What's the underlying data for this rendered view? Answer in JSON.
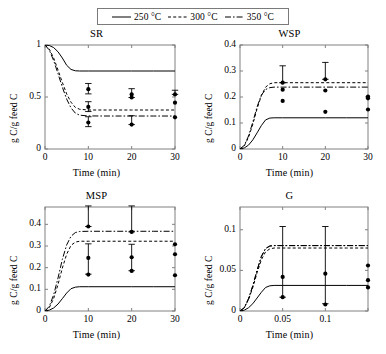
{
  "figure": {
    "legend": {
      "entries": [
        {
          "label": "250 °C",
          "style": "solid",
          "color": "#000000"
        },
        {
          "label": "300 °C",
          "style": "dashed",
          "color": "#000000"
        },
        {
          "label": "350 °C",
          "style": "dashdot",
          "color": "#000000"
        }
      ]
    },
    "axis_label_x": "Time (min)",
    "axis_label_y": "g C/g feed C"
  },
  "chart_data": [
    {
      "type": "line",
      "title": "SR",
      "xlabel": "Time (min)",
      "ylabel": "g C/g feed C",
      "xlim": [
        0,
        30
      ],
      "ylim": [
        0,
        1
      ],
      "xticks": [
        0,
        10,
        20,
        30
      ],
      "yticks": [
        0,
        0.5,
        1
      ],
      "xtick_labels": [
        "0",
        "10",
        "20",
        "30"
      ],
      "ytick_labels": [
        "0",
        "0.5",
        "1"
      ],
      "grid": false,
      "legend_position": "figure-top",
      "series": [
        {
          "name": "250 °C",
          "style": "solid",
          "x": [
            0,
            1,
            2,
            3,
            4,
            5,
            6,
            7,
            8,
            10,
            15,
            20,
            25,
            30
          ],
          "values": [
            1,
            0.995,
            0.975,
            0.935,
            0.875,
            0.805,
            0.765,
            0.752,
            0.75,
            0.75,
            0.75,
            0.75,
            0.75,
            0.75
          ]
        },
        {
          "name": "300 °C",
          "style": "dashed",
          "x": [
            0,
            1,
            2,
            3,
            4,
            5,
            6,
            7,
            8,
            10,
            15,
            20,
            25,
            30
          ],
          "values": [
            1,
            0.96,
            0.875,
            0.76,
            0.64,
            0.53,
            0.45,
            0.4,
            0.382,
            0.375,
            0.375,
            0.375,
            0.375,
            0.375
          ]
        },
        {
          "name": "350 °C",
          "style": "dashdot",
          "x": [
            0,
            1,
            2,
            3,
            4,
            5,
            6,
            7,
            8,
            10,
            15,
            20,
            25,
            30
          ],
          "values": [
            1,
            0.95,
            0.85,
            0.725,
            0.595,
            0.48,
            0.395,
            0.345,
            0.325,
            0.318,
            0.317,
            0.317,
            0.317,
            0.317
          ]
        }
      ],
      "scatter": [
        {
          "x": 10,
          "y": 0.575,
          "yerr_low": 0.045,
          "yerr_high": 0.055
        },
        {
          "x": 10,
          "y": 0.405,
          "yerr_low": 0.045,
          "yerr_high": 0.05
        },
        {
          "x": 10,
          "y": 0.255,
          "yerr_low": 0.04,
          "yerr_high": 0.055
        },
        {
          "x": 20,
          "y": 0.525,
          "yerr_low": 0.03,
          "yerr_high": 0.055
        },
        {
          "x": 20,
          "y": 0.495,
          "yerr_low": 0.0,
          "yerr_high": 0.0
        },
        {
          "x": 20,
          "y": 0.235,
          "yerr_low": 0.0,
          "yerr_high": 0.085
        },
        {
          "x": 30,
          "y": 0.525,
          "yerr_low": 0.0,
          "yerr_high": 0.04
        },
        {
          "x": 30,
          "y": 0.445,
          "yerr_low": 0.0,
          "yerr_high": 0.0
        },
        {
          "x": 30,
          "y": 0.305,
          "yerr_low": 0.0,
          "yerr_high": 0.0
        }
      ]
    },
    {
      "type": "line",
      "title": "WSP",
      "xlabel": "Time (min)",
      "ylabel": "g C/g feed C",
      "xlim": [
        0,
        30
      ],
      "ylim": [
        0,
        0.4
      ],
      "xticks": [
        0,
        10,
        20,
        30
      ],
      "yticks": [
        0,
        0.1,
        0.2,
        0.3,
        0.4
      ],
      "xtick_labels": [
        "0",
        "10",
        "20",
        "30"
      ],
      "ytick_labels": [
        "0",
        "0.1",
        "0.2",
        "0.3",
        "0.4"
      ],
      "grid": false,
      "legend_position": "figure-top",
      "series": [
        {
          "name": "250 °C",
          "style": "solid",
          "x": [
            0,
            1,
            2,
            3,
            4,
            5,
            6,
            7,
            8,
            10,
            15,
            20,
            25,
            30
          ],
          "values": [
            0,
            0.004,
            0.015,
            0.035,
            0.062,
            0.09,
            0.112,
            0.119,
            0.12,
            0.12,
            0.12,
            0.12,
            0.12,
            0.12
          ]
        },
        {
          "name": "300 °C",
          "style": "dashed",
          "x": [
            0,
            1,
            2,
            3,
            4,
            5,
            6,
            7,
            8,
            10,
            15,
            20,
            25,
            30
          ],
          "values": [
            0,
            0.012,
            0.045,
            0.095,
            0.155,
            0.205,
            0.238,
            0.251,
            0.255,
            0.255,
            0.255,
            0.255,
            0.255,
            0.255
          ]
        },
        {
          "name": "350 °C",
          "style": "dashdot",
          "x": [
            0,
            1,
            2,
            3,
            4,
            5,
            6,
            7,
            8,
            10,
            15,
            20,
            25,
            30
          ],
          "values": [
            0,
            0.014,
            0.05,
            0.103,
            0.162,
            0.207,
            0.229,
            0.236,
            0.238,
            0.238,
            0.238,
            0.238,
            0.238,
            0.238
          ]
        }
      ],
      "scatter": [
        {
          "x": 10,
          "y": 0.255,
          "yerr_low": 0.0,
          "yerr_high": 0.065
        },
        {
          "x": 10,
          "y": 0.228,
          "yerr_low": 0.0,
          "yerr_high": 0.0
        },
        {
          "x": 10,
          "y": 0.185,
          "yerr_low": 0.0,
          "yerr_high": 0.0
        },
        {
          "x": 20,
          "y": 0.268,
          "yerr_low": 0.0,
          "yerr_high": 0.065
        },
        {
          "x": 20,
          "y": 0.225,
          "yerr_low": 0.0,
          "yerr_high": 0.0
        },
        {
          "x": 20,
          "y": 0.143,
          "yerr_low": 0.0,
          "yerr_high": 0.0
        },
        {
          "x": 30,
          "y": 0.202,
          "yerr_low": 0.0,
          "yerr_high": 0.0
        },
        {
          "x": 30,
          "y": 0.195,
          "yerr_low": 0.0,
          "yerr_high": 0.0
        },
        {
          "x": 30,
          "y": 0.152,
          "yerr_low": 0.0,
          "yerr_high": 0.0
        }
      ]
    },
    {
      "type": "line",
      "title": "MSP",
      "xlabel": "Time (min)",
      "ylabel": "g C/g feed C",
      "xlim": [
        0,
        30
      ],
      "ylim": [
        0,
        0.48
      ],
      "xticks": [
        0,
        10,
        20,
        30
      ],
      "yticks": [
        0,
        0.1,
        0.2,
        0.3,
        0.4
      ],
      "xtick_labels": [
        "0",
        "10",
        "20",
        "30"
      ],
      "ytick_labels": [
        "0",
        "0.1",
        "0.2",
        "0.3",
        "0.4"
      ],
      "grid": false,
      "legend_position": "figure-top",
      "series": [
        {
          "name": "250 °C",
          "style": "solid",
          "x": [
            0,
            1,
            2,
            3,
            4,
            5,
            6,
            7,
            8,
            10,
            15,
            20,
            25,
            30
          ],
          "values": [
            0,
            0.004,
            0.014,
            0.032,
            0.057,
            0.083,
            0.103,
            0.11,
            0.112,
            0.112,
            0.112,
            0.112,
            0.112,
            0.112
          ]
        },
        {
          "name": "300 °C",
          "style": "dashed",
          "x": [
            0,
            1,
            2,
            3,
            4,
            5,
            6,
            7,
            8,
            10,
            15,
            20,
            25,
            30
          ],
          "values": [
            0,
            0.016,
            0.058,
            0.122,
            0.198,
            0.262,
            0.303,
            0.318,
            0.322,
            0.322,
            0.322,
            0.322,
            0.322,
            0.322
          ]
        },
        {
          "name": "350 °C",
          "style": "dashdot",
          "x": [
            0,
            1,
            2,
            3,
            4,
            5,
            6,
            7,
            8,
            10,
            15,
            20,
            25,
            30
          ],
          "values": [
            0,
            0.022,
            0.075,
            0.152,
            0.238,
            0.305,
            0.345,
            0.362,
            0.367,
            0.368,
            0.368,
            0.368,
            0.368,
            0.368
          ]
        }
      ],
      "scatter": [
        {
          "x": 10,
          "y": 0.39,
          "yerr_low": 0.0,
          "yerr_high": 0.095
        },
        {
          "x": 10,
          "y": 0.245,
          "yerr_low": 0.075,
          "yerr_high": 0.065
        },
        {
          "x": 10,
          "y": 0.168,
          "yerr_low": 0.0,
          "yerr_high": 0.0
        },
        {
          "x": 20,
          "y": 0.365,
          "yerr_low": 0.0,
          "yerr_high": 0.12
        },
        {
          "x": 20,
          "y": 0.248,
          "yerr_low": 0.062,
          "yerr_high": 0.06
        },
        {
          "x": 20,
          "y": 0.185,
          "yerr_low": 0.0,
          "yerr_high": 0.0
        },
        {
          "x": 30,
          "y": 0.308,
          "yerr_low": 0.0,
          "yerr_high": 0.0
        },
        {
          "x": 30,
          "y": 0.262,
          "yerr_low": 0.0,
          "yerr_high": 0.0
        },
        {
          "x": 30,
          "y": 0.165,
          "yerr_low": 0.0,
          "yerr_high": 0.0
        }
      ]
    },
    {
      "type": "line",
      "title": "G",
      "xlabel": "Time (min)",
      "ylabel": "g C/g feed C",
      "xlim": [
        0,
        30
      ],
      "ylim": [
        0,
        0.128
      ],
      "xticks": [
        0,
        10,
        20,
        30
      ],
      "yticks": [
        0,
        0.05,
        0.1
      ],
      "xtick_labels": [
        "0",
        "0.05",
        "0.1"
      ],
      "ytick_labels": [
        "0",
        "0.05",
        "0.1"
      ],
      "grid": false,
      "legend_position": "figure-top",
      "series": [
        {
          "name": "250 °C",
          "style": "solid",
          "x": [
            0,
            1,
            2,
            3,
            4,
            5,
            6,
            7,
            8,
            10,
            15,
            20,
            25,
            30
          ],
          "values": [
            0,
            0.001,
            0.004,
            0.009,
            0.016,
            0.023,
            0.029,
            0.031,
            0.0315,
            0.0315,
            0.0315,
            0.0315,
            0.0315,
            0.0315
          ]
        },
        {
          "name": "300 °C",
          "style": "dashed",
          "x": [
            0,
            1,
            2,
            3,
            4,
            5,
            6,
            7,
            8,
            10,
            15,
            20,
            25,
            30
          ],
          "values": [
            0,
            0.004,
            0.014,
            0.029,
            0.047,
            0.063,
            0.073,
            0.0765,
            0.0775,
            0.0775,
            0.0775,
            0.0775,
            0.0775,
            0.0775
          ]
        },
        {
          "name": "350 °C",
          "style": "dashdot",
          "x": [
            0,
            1,
            2,
            3,
            4,
            5,
            6,
            7,
            8,
            10,
            15,
            20,
            25,
            30
          ],
          "values": [
            0,
            0.004,
            0.015,
            0.031,
            0.05,
            0.067,
            0.077,
            0.08,
            0.0805,
            0.0805,
            0.0805,
            0.0805,
            0.0805,
            0.0805
          ]
        },
        {
          "name": "350 °C",
          "style": "dashdot",
          "x": [
            0,
            1,
            2,
            3,
            4,
            5,
            6,
            7,
            8,
            10,
            15,
            20,
            25,
            30
          ],
          "values": [
            0,
            0.004,
            0.015,
            0.031,
            0.05,
            0.067,
            0.077,
            0.08,
            0.0805,
            0.0805,
            0.0805,
            0.0805,
            0.0805,
            0.0805
          ]
        }
      ],
      "scatter": [
        {
          "x": 10,
          "y": 0.042,
          "yerr_low": 0.025,
          "yerr_high": 0.062
        },
        {
          "x": 10,
          "y": 0.017,
          "yerr_low": 0.0,
          "yerr_high": 0.0
        },
        {
          "x": 20,
          "y": 0.046,
          "yerr_low": 0.037,
          "yerr_high": 0.058
        },
        {
          "x": 20,
          "y": 0.008,
          "yerr_low": 0.0,
          "yerr_high": 0.0
        },
        {
          "x": 30,
          "y": 0.056,
          "yerr_low": 0.0,
          "yerr_high": 0.0
        },
        {
          "x": 30,
          "y": 0.038,
          "yerr_low": 0.0,
          "yerr_high": 0.0
        },
        {
          "x": 30,
          "y": 0.029,
          "yerr_low": 0.0,
          "yerr_high": 0.0
        }
      ]
    }
  ]
}
